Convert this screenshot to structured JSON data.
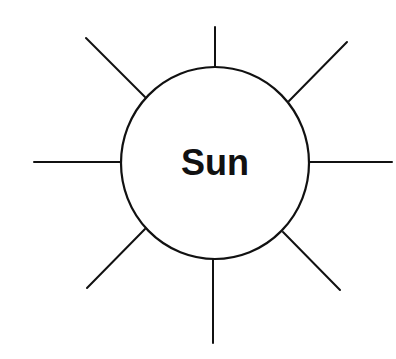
{
  "diagram": {
    "center_label": "Sun",
    "colors": {
      "stroke": "#111111",
      "background": "#ffffff",
      "text": "#111111"
    },
    "circle": {
      "cx": 215,
      "cy": 163,
      "rx": 94,
      "ry": 96
    },
    "rays": [
      {
        "name": "top",
        "x1": 215,
        "y1": 27,
        "x2": 215,
        "y2": 67
      },
      {
        "name": "top-right",
        "x1": 289,
        "y1": 101,
        "x2": 347,
        "y2": 42
      },
      {
        "name": "right",
        "x1": 309,
        "y1": 162,
        "x2": 392,
        "y2": 162
      },
      {
        "name": "bottom-right",
        "x1": 283,
        "y1": 232,
        "x2": 340,
        "y2": 290
      },
      {
        "name": "bottom",
        "x1": 213,
        "y1": 259,
        "x2": 213,
        "y2": 343
      },
      {
        "name": "bottom-left",
        "x1": 145,
        "y1": 229,
        "x2": 87,
        "y2": 288
      },
      {
        "name": "left",
        "x1": 121,
        "y1": 162,
        "x2": 34,
        "y2": 162
      },
      {
        "name": "top-left",
        "x1": 145,
        "y1": 97,
        "x2": 86,
        "y2": 38
      }
    ]
  }
}
